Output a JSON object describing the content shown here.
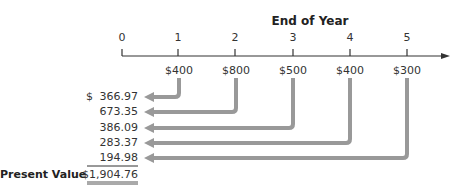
{
  "title": "End of Year",
  "timeline": {
    "ticks": [
      "0",
      "1",
      "2",
      "3",
      "4",
      "5"
    ],
    "cash_flows": [
      "$400",
      "$800",
      "$500",
      "$400",
      "$300"
    ]
  },
  "present_values": {
    "dollar_sign": "$",
    "rows": [
      "366.97",
      "673.35",
      "386.09",
      "283.37",
      "194.98"
    ],
    "total_label": "Present Value",
    "total": "$1,904.76"
  },
  "colors": {
    "arrow": "#999999",
    "axis": "#333333"
  }
}
